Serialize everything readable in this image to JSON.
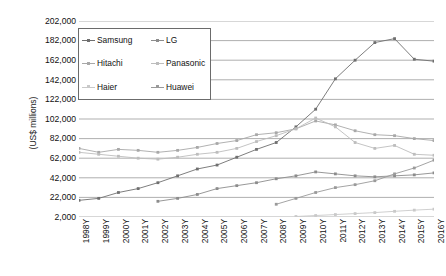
{
  "chart_data": {
    "type": "line",
    "title": "",
    "xlabel": "",
    "ylabel": "(US$ millions)",
    "ylim": [
      2000,
      202000
    ],
    "ytick_values": [
      202000,
      182000,
      162000,
      142000,
      122000,
      102000,
      82000,
      62000,
      42000,
      22000,
      2000
    ],
    "ytick_labels": [
      "202,000",
      "182,000",
      "162,000",
      "142,000",
      "122,000",
      "102,000",
      "82,000",
      "62,000",
      "42,000",
      "22,000",
      "2,000"
    ],
    "grid": true,
    "legend_position": "top-left-inside",
    "categories": [
      "1998Y",
      "1999Y",
      "2000Y",
      "2001Y",
      "2002Y",
      "2003Y",
      "2004Y",
      "2005Y",
      "2006Y",
      "2007Y",
      "2008Y",
      "2009Y",
      "2010Y",
      "2011Y",
      "2012Y",
      "2013Y",
      "2014Y",
      "2015Y",
      "2016Y"
    ],
    "series": [
      {
        "name": "Samsung",
        "color": "#6f6f6f",
        "values": [
          19000,
          21000,
          27000,
          31000,
          37000,
          44000,
          51000,
          55000,
          63000,
          71000,
          78000,
          94000,
          112000,
          143000,
          162000,
          180000,
          184000,
          163000,
          161000
        ]
      },
      {
        "name": "LG",
        "color": "#8c8c8c",
        "values": [
          null,
          null,
          null,
          null,
          18000,
          21000,
          25000,
          31000,
          34000,
          37000,
          41000,
          44000,
          48000,
          46000,
          44000,
          43000,
          44000,
          45000,
          47000
        ]
      },
      {
        "name": "Hitachi",
        "color": "#a8a8a8",
        "values": [
          72000,
          68000,
          71000,
          70000,
          68000,
          70000,
          73000,
          77000,
          80000,
          86000,
          88000,
          92000,
          100000,
          96000,
          90000,
          86000,
          85000,
          82000,
          80000
        ]
      },
      {
        "name": "Panasonic",
        "color": "#bdbdbd",
        "values": [
          68000,
          66000,
          64000,
          62000,
          61000,
          63000,
          66000,
          68000,
          72000,
          79000,
          85000,
          92000,
          103000,
          94000,
          78000,
          72000,
          75000,
          66000,
          65000
        ]
      },
      {
        "name": "Haier",
        "color": "#c9c9c9",
        "values": [
          null,
          null,
          null,
          null,
          null,
          null,
          null,
          null,
          null,
          null,
          null,
          2500,
          3500,
          4500,
          5500,
          6500,
          7800,
          9000,
          10000
        ]
      },
      {
        "name": "Huawei",
        "color": "#9a9a9a",
        "values": [
          null,
          null,
          null,
          null,
          null,
          null,
          null,
          null,
          null,
          null,
          15000,
          21000,
          27000,
          32000,
          35000,
          39000,
          46000,
          52000,
          60000
        ]
      }
    ]
  },
  "legend": {
    "items": [
      {
        "label": "Samsung"
      },
      {
        "label": "LG"
      },
      {
        "label": "Hitachi"
      },
      {
        "label": "Panasonic"
      },
      {
        "label": "Haier"
      },
      {
        "label": "Huawei"
      }
    ]
  }
}
